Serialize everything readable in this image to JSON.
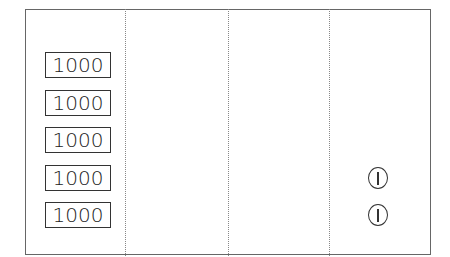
{
  "diagram": {
    "columns": 4,
    "column_1": {
      "items": [
        {
          "label": "1000"
        },
        {
          "label": "1000"
        },
        {
          "label": "1000"
        },
        {
          "label": "1000"
        },
        {
          "label": "1000"
        }
      ]
    },
    "column_2": {
      "items": []
    },
    "column_3": {
      "items": []
    },
    "column_4": {
      "items": [
        {
          "icon": "one-coin-icon"
        },
        {
          "icon": "one-coin-icon"
        }
      ]
    }
  }
}
